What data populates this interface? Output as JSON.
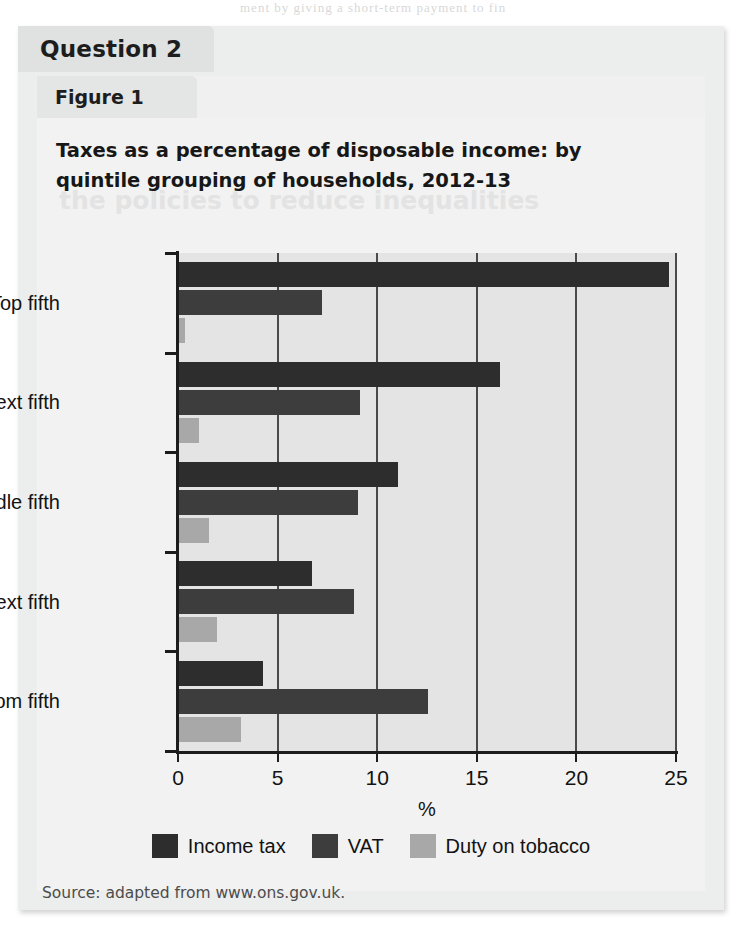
{
  "page": {
    "bleed_top_text": "ment by giving a short-term payment to fin",
    "bleed_heading_text": "the policies to reduce inequalities"
  },
  "question": {
    "tab_label": "Question 2"
  },
  "figure": {
    "tab_label": "Figure 1",
    "source": "Source: adapted from www.ons.gov.uk."
  },
  "chart_data": {
    "type": "bar",
    "orientation": "horizontal",
    "title": "Taxes as a percentage of disposable income: by quintile grouping of households, 2012-13",
    "xlabel": "%",
    "ylabel": "",
    "xlim": [
      0,
      25
    ],
    "xticks": [
      0,
      5,
      10,
      15,
      20,
      25
    ],
    "xtick_labels": [
      "0",
      "5",
      "10",
      "15",
      "20",
      "25"
    ],
    "grid": true,
    "grid_axis": "x",
    "legend_position": "bottom",
    "categories": [
      "Bottom fifth",
      "Next fifth",
      "Middle fifth",
      "Next fifth",
      "Top fifth"
    ],
    "categories_top_to_bottom": [
      "Top fifth",
      "Next fifth",
      "Middle fifth",
      "Next fifth",
      "Bottom fifth"
    ],
    "series": [
      {
        "name": "Income tax",
        "color": "#2d2d2d",
        "values_top_to_bottom": [
          24.6,
          16.1,
          11.0,
          6.7,
          4.2
        ]
      },
      {
        "name": "VAT",
        "color": "#3d3d3d",
        "values_top_to_bottom": [
          7.2,
          9.1,
          9.0,
          8.8,
          12.5
        ]
      },
      {
        "name": "Duty on tobacco",
        "color": "#a8a8a8",
        "values_top_to_bottom": [
          0.3,
          1.0,
          1.5,
          1.9,
          3.1
        ]
      }
    ]
  }
}
